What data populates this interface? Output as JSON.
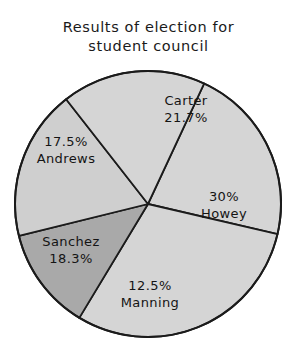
{
  "title": {
    "line1": "Results of election for",
    "line2": "student council"
  },
  "chart_data": {
    "type": "pie",
    "title": "Results of election for student council",
    "subtitle": "",
    "xlabel": "",
    "ylabel": "",
    "grid": false,
    "legend": "none",
    "label_placement": "inside-slices",
    "units": "percent",
    "total": 100,
    "categories": [
      "Carter",
      "Howey",
      "Manning",
      "Sanchez",
      "Andrews"
    ],
    "values": [
      21.7,
      30,
      12.5,
      18.3,
      17.5
    ],
    "slices": [
      {
        "name": "Carter",
        "value": 21.7,
        "value_label": "21.7%",
        "start_angle": -65,
        "end_angle": 13.1,
        "fill": "#d5d5d5",
        "stroke": "#1b1b1b",
        "label_first_line": "Carter",
        "label_second_line": "21.7%"
      },
      {
        "name": "Howey",
        "value": 30,
        "value_label": "30%",
        "start_angle": 13.1,
        "end_angle": 121.1,
        "fill": "#d5d5d5",
        "stroke": "#1b1b1b",
        "label_first_line": "30%",
        "label_second_line": "Howey"
      },
      {
        "name": "Manning",
        "value": 12.5,
        "value_label": "12.5%",
        "start_angle": 121.1,
        "end_angle": 166.1,
        "fill": "#a9a9a9",
        "stroke": "#1b1b1b",
        "label_first_line": "12.5%",
        "label_second_line": "Manning"
      },
      {
        "name": "Sanchez",
        "value": 18.3,
        "value_label": "18.3%",
        "start_angle": 166.1,
        "end_angle": 232.0,
        "fill": "#cfcfcf",
        "stroke": "#1b1b1b",
        "label_first_line": "Sanchez",
        "label_second_line": "18.3%"
      },
      {
        "name": "Andrews",
        "value": 17.5,
        "value_label": "17.5%",
        "start_angle": 232.0,
        "end_angle": 295.0,
        "fill": "#d5d5d5",
        "stroke": "#1b1b1b",
        "label_first_line": "17.5%",
        "label_second_line": "Andrews"
      }
    ],
    "geometry": {
      "center_x": 148,
      "center_y": 204,
      "radius": 133
    },
    "colors": {
      "slice_light": "#d5d5d5",
      "slice_dark": "#a9a9a9",
      "outline": "#1b1b1b",
      "text": "#141414",
      "background": "#ffffff"
    }
  }
}
